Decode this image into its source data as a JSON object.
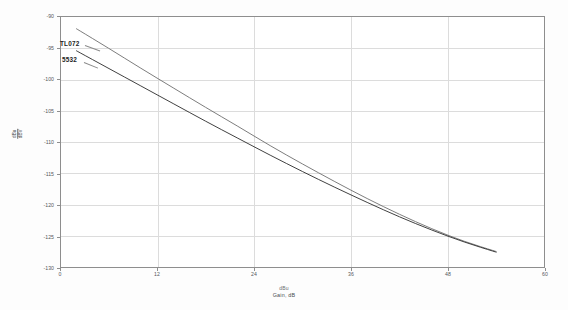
{
  "chart_data": {
    "type": "line",
    "title": "",
    "xlabel": "Gain, dB",
    "xlabel_top": "dBu",
    "ylabel_top": "dBu",
    "ylabel_bottom": "dBV",
    "ylabel_prefix": "Noise,",
    "xlim": [
      0,
      60
    ],
    "ylim": [
      -130,
      -90
    ],
    "xticks": [
      0,
      12,
      24,
      36,
      48,
      60
    ],
    "yticks": [
      -90,
      -95,
      -100,
      -105,
      -110,
      -115,
      -120,
      -125,
      -130
    ],
    "grid": true,
    "legend": "inline-annotations",
    "series": [
      {
        "name": "TL072",
        "color": "#6e6e6e",
        "x": [
          2,
          6,
          10,
          14,
          18,
          22,
          26,
          30,
          34,
          38,
          42,
          46,
          50,
          54
        ],
        "values": [
          -92.0,
          -95.1,
          -98.3,
          -101.4,
          -104.5,
          -107.5,
          -110.6,
          -113.5,
          -116.3,
          -119.0,
          -121.5,
          -123.8,
          -125.8,
          -127.4
        ]
      },
      {
        "name": "5532",
        "color": "#2b2b2b",
        "x": [
          2,
          6,
          10,
          14,
          18,
          22,
          26,
          30,
          34,
          38,
          42,
          46,
          50,
          54
        ],
        "values": [
          -95.5,
          -98.3,
          -101.1,
          -103.9,
          -106.7,
          -109.4,
          -112.1,
          -114.7,
          -117.2,
          -119.6,
          -121.9,
          -124.0,
          -125.9,
          -127.5
        ]
      }
    ]
  }
}
